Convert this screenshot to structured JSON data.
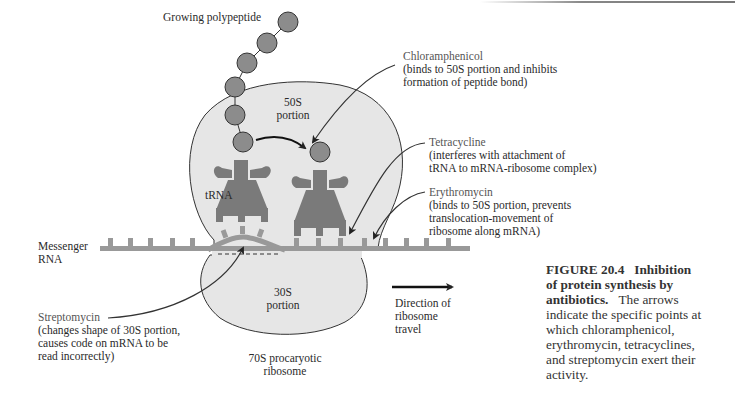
{
  "figure": {
    "number": "FIGURE 20.4",
    "title": "Inhibition of protein synthesis by antibiotics.",
    "title_line1": "Inhibition",
    "title_line2": "of protein synthesis by",
    "title_line3": "antibiotics.",
    "body_line1": "The arrows",
    "body_line2": "indicate the specific points at",
    "body_line3": "which chloramphenicol,",
    "body_line4": "erythromycin, tetracyclines,",
    "body_line5": "and streptomycin exert their",
    "body_line6": "activity."
  },
  "labels": {
    "growing_polypeptide": "Growing polypeptide",
    "large_subunit_1": "50S",
    "large_subunit_2": "portion",
    "small_subunit_1": "30S",
    "small_subunit_2": "portion",
    "trna": "tRNA",
    "mrna_1": "Messenger",
    "mrna_2": "RNA",
    "ribosome_1": "70S procaryotic",
    "ribosome_2": "ribosome",
    "direction_1": "Direction of",
    "direction_2": "ribosome",
    "direction_3": "travel"
  },
  "antibiotics": [
    {
      "name": "Chloramphenicol",
      "line1": "(binds to 50S portion and inhibits",
      "line2": "formation of peptide bond)"
    },
    {
      "name": "Tetracycline",
      "line1": "(interferes with attachment of",
      "line2": "tRNA to mRNA-ribosome complex)"
    },
    {
      "name": "Erythromycin",
      "line1": "(binds to 50S portion, prevents",
      "line2": "translocation-movement of",
      "line3": "ribosome along mRNA)"
    },
    {
      "name": "Streptomycin",
      "line1": "(changes shape of 30S portion,",
      "line2": "causes code on mRNA to be",
      "line3": "read incorrectly)"
    }
  ],
  "colors": {
    "ribosome_fill": "#e6e6e6",
    "trna_fill": "#7a7a7a",
    "mrna_fill": "#999999",
    "amino_acid_fill": "#8c8c8c",
    "outline": "#333333"
  }
}
